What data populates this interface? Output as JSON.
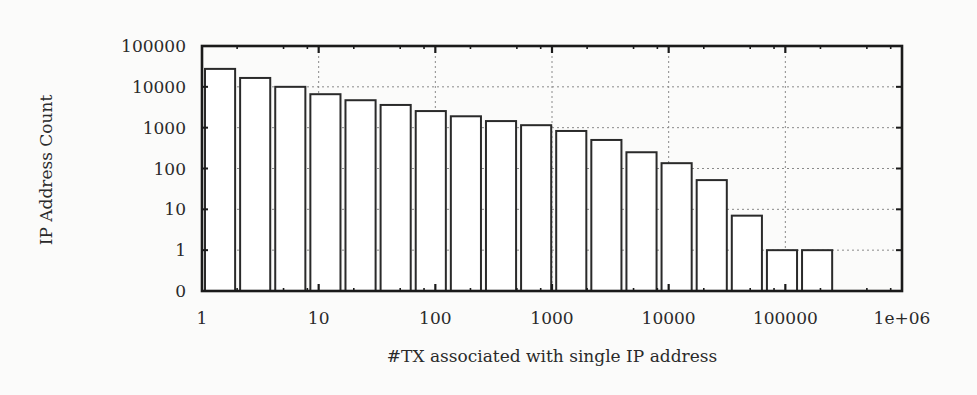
{
  "chart_data": {
    "type": "bar",
    "title": "",
    "xlabel": "#TX associated with single IP address",
    "ylabel": "IP Address Count",
    "xscale": "log",
    "yscale": "log",
    "x_ticks": [
      "1",
      "10",
      "100",
      "1000",
      "10000",
      "100000",
      "1e+06"
    ],
    "y_ticks": [
      "0",
      "1",
      "10",
      "100",
      "1000",
      "10000",
      "100000"
    ],
    "xlim": [
      1,
      1000000
    ],
    "ylim": [
      0.1,
      100000
    ],
    "grid": true,
    "legend": null,
    "bin_edges_note": "log-spaced bins, factor 2",
    "categories": [
      "1",
      "2",
      "4",
      "8",
      "16",
      "32",
      "64",
      "128",
      "256",
      "512",
      "1024",
      "2048",
      "4096",
      "8192",
      "16384",
      "32768",
      "65536",
      "131072"
    ],
    "values": [
      27500,
      16500,
      10000,
      6600,
      4700,
      3600,
      2550,
      1900,
      1450,
      1150,
      830,
      500,
      250,
      135,
      52,
      7,
      1,
      1
    ]
  },
  "colors": {
    "background": "#fbfbfa",
    "bar_fill": "#ffffff",
    "bar_stroke": "#2a2a2a",
    "frame": "#1a1a1a",
    "grid": "#8a8a8a"
  }
}
